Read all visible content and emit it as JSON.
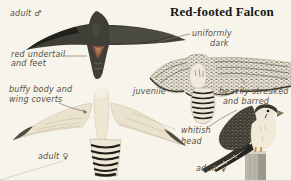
{
  "title": "Red-footed Falcon",
  "annotations": {
    "adult_male": "adult ♂",
    "red_undertail": [
      "red undertail",
      "and feet"
    ],
    "uniformly_dark": [
      "uniformly",
      "dark"
    ],
    "juvenile": "juvenile",
    "buffy_body": [
      "buffy body and",
      "wing coverts"
    ],
    "adult_female_flight": "adult ♀",
    "heavily_streaked": [
      "heavily streaked",
      "and barred"
    ],
    "whitish_head": [
      "whitish",
      "head"
    ],
    "adult_female_perched": "adult ♀"
  },
  "figures": [
    {
      "name": "adult-male-flight",
      "description": "uniformly dark falcon seen from below with red undertail"
    },
    {
      "name": "juvenile-flight",
      "description": "pale heavily streaked falcon in flight with barred tail"
    },
    {
      "name": "adult-female-flight",
      "description": "buffy falcon seen from below with barred tail"
    },
    {
      "name": "adult-female-perched",
      "description": "whitish-headed streaked falcon perched on wooden post"
    }
  ],
  "colors": {
    "paper": "#f7f4ec",
    "label_ink": "#55503f",
    "title_ink": "#181818",
    "leader_line": "#7b7668",
    "male_plumage": "#3f3e37",
    "red_undertail": "#8a583f",
    "buffy_body": "#ede4cf",
    "streaked_pale": "#e9e4d4",
    "streaked_dark": "#3f3e34",
    "tail_bar_black": "#201f1a",
    "post_gray": "#b9b5a8"
  }
}
